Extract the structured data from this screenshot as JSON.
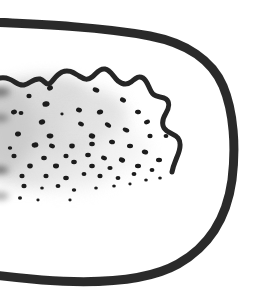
{
  "figure": {
    "caption": "",
    "background_color": "#ffffff",
    "canvas": {
      "width": 260,
      "height": 300
    }
  },
  "colors": {
    "ink": "#2b2b2b",
    "ink_dark": "#1c1c1c",
    "dot": "#1a1a1a",
    "shade_light": "#e3e3e3",
    "shade_mid": "#d4d4d4",
    "shade_edge": "#bdbdbd",
    "paper": "#ffffff"
  },
  "strokes": {
    "body_outline": {
      "label": "body-outline",
      "width": 9,
      "color": "#2b2b2b",
      "path": "M -14 22 C 30 24, 96 26, 150 36 C 186 43, 212 60, 223 86 C 234 112, 236 148, 232 180 C 227 216, 210 246, 178 264 C 146 282, 96 284, 42 280 C 20 278, 2 276, -14 274"
    },
    "outline_top_tail": {
      "label": "outline-top-tail",
      "width": 7,
      "color": "#2b2b2b",
      "path": "M -16 19 C -6 20, 6 22, 18 23"
    },
    "wavy_boundary": {
      "label": "wavy-patch-boundary",
      "width": 5,
      "color": "#262626",
      "path": "M -12 82 C -4 79, 2 76, 9 79 C 15 81, 18 86, 24 85 C 30 84, 33 78, 40 79 C 44 80, 45 84, 48 84 C 52 84, 54 76, 62 72 C 69 69, 74 73, 79 76 C 84 79, 87 81, 92 77 C 96 74, 99 68, 105 69 C 111 70, 113 77, 118 81 C 123 85, 127 85, 131 82 C 135 79, 138 75, 143 78 C 148 81, 149 90, 153 94 C 157 98, 162 96, 166 99 C 170 102, 169 108, 166 113 C 163 118, 161 123, 164 128 C 167 133, 174 133, 178 138 C 182 143, 180 150, 177 157 C 175 162, 173 166, 172 172"
    }
  },
  "shading": {
    "label": "gray-stipple-shading",
    "blobs": [
      {
        "cx": 34,
        "cy": 100,
        "rx": 52,
        "ry": 23,
        "rot": -8,
        "color": "#d9d9d9",
        "opacity": 0.95,
        "blur": 7
      },
      {
        "cx": 58,
        "cy": 118,
        "rx": 66,
        "ry": 30,
        "rot": -6,
        "color": "#dcdcdc",
        "opacity": 0.9,
        "blur": 8
      },
      {
        "cx": 44,
        "cy": 140,
        "rx": 58,
        "ry": 30,
        "rot": -4,
        "color": "#d6d6d6",
        "opacity": 0.9,
        "blur": 8
      },
      {
        "cx": 24,
        "cy": 160,
        "rx": 44,
        "ry": 26,
        "rot": 0,
        "color": "#dadada",
        "opacity": 0.85,
        "blur": 8
      },
      {
        "cx": 92,
        "cy": 126,
        "rx": 34,
        "ry": 22,
        "rot": -10,
        "color": "#e4e4e4",
        "opacity": 0.85,
        "blur": 9
      },
      {
        "cx": 8,
        "cy": 128,
        "rx": 26,
        "ry": 42,
        "rot": 0,
        "color": "#c9c9c9",
        "opacity": 0.9,
        "blur": 8
      },
      {
        "cx": 70,
        "cy": 168,
        "rx": 46,
        "ry": 20,
        "rot": -3,
        "color": "#e6e6e6",
        "opacity": 0.8,
        "blur": 9
      },
      {
        "cx": 120,
        "cy": 150,
        "rx": 28,
        "ry": 20,
        "rot": 0,
        "color": "#efefef",
        "opacity": 0.7,
        "blur": 9
      }
    ],
    "left_edge_smudges": [
      {
        "cx": -2,
        "cy": 92,
        "rx": 12,
        "ry": 5,
        "color": "#5a5a5a",
        "opacity": 0.75,
        "blur": 3
      },
      {
        "cx": -1,
        "cy": 118,
        "rx": 10,
        "ry": 4,
        "color": "#6a6a6a",
        "opacity": 0.7,
        "blur": 3
      },
      {
        "cx": -2,
        "cy": 170,
        "rx": 11,
        "ry": 4,
        "color": "#4f4f4f",
        "opacity": 0.75,
        "blur": 3
      },
      {
        "cx": 0,
        "cy": 196,
        "rx": 9,
        "ry": 4,
        "color": "#707070",
        "opacity": 0.6,
        "blur": 3
      }
    ]
  },
  "stipple": {
    "label": "stipple-dot-field",
    "count": 62,
    "color": "#1a1a1a",
    "dots": [
      {
        "cx": 50,
        "cy": 88,
        "rx": 3.0,
        "ry": 2.4,
        "rot": -25
      },
      {
        "cx": 96,
        "cy": 90,
        "rx": 3.4,
        "ry": 2.4,
        "rot": 20
      },
      {
        "cx": 29,
        "cy": 96,
        "rx": 2.6,
        "ry": 2.2,
        "rot": 0
      },
      {
        "cx": 123,
        "cy": 100,
        "rx": 3.2,
        "ry": 2.3,
        "rot": 30
      },
      {
        "cx": 14,
        "cy": 112,
        "rx": 3.0,
        "ry": 2.3,
        "rot": -15
      },
      {
        "cx": 46,
        "cy": 104,
        "rx": 3.6,
        "ry": 2.8,
        "rot": -10
      },
      {
        "cx": 21,
        "cy": 113,
        "rx": 2.4,
        "ry": 2.0,
        "rot": 0
      },
      {
        "cx": 79,
        "cy": 110,
        "rx": 3.0,
        "ry": 2.4,
        "rot": 15
      },
      {
        "cx": 100,
        "cy": 112,
        "rx": 3.2,
        "ry": 2.4,
        "rot": -20
      },
      {
        "cx": 138,
        "cy": 112,
        "rx": 3.0,
        "ry": 2.2,
        "rot": 10
      },
      {
        "cx": 62,
        "cy": 114,
        "rx": 1.6,
        "ry": 1.4,
        "rot": 0
      },
      {
        "cx": 42,
        "cy": 122,
        "rx": 3.2,
        "ry": 2.6,
        "rot": -12
      },
      {
        "cx": 81,
        "cy": 124,
        "rx": 3.0,
        "ry": 2.2,
        "rot": 25
      },
      {
        "cx": 108,
        "cy": 125,
        "rx": 3.4,
        "ry": 2.2,
        "rot": 35
      },
      {
        "cx": 147,
        "cy": 122,
        "rx": 3.0,
        "ry": 2.2,
        "rot": -18
      },
      {
        "cx": 126,
        "cy": 130,
        "rx": 3.4,
        "ry": 2.2,
        "rot": 25
      },
      {
        "cx": 18,
        "cy": 134,
        "rx": 3.0,
        "ry": 2.4,
        "rot": -8
      },
      {
        "cx": 50,
        "cy": 136,
        "rx": 3.4,
        "ry": 2.4,
        "rot": -5
      },
      {
        "cx": 92,
        "cy": 136,
        "rx": 3.2,
        "ry": 2.6,
        "rot": 12
      },
      {
        "cx": 150,
        "cy": 136,
        "rx": 2.6,
        "ry": 2.2,
        "rot": 0
      },
      {
        "cx": 166,
        "cy": 136,
        "rx": 2.4,
        "ry": 2.0,
        "rot": 0
      },
      {
        "cx": 35,
        "cy": 145,
        "rx": 3.4,
        "ry": 2.6,
        "rot": -10
      },
      {
        "cx": 52,
        "cy": 146,
        "rx": 3.0,
        "ry": 2.2,
        "rot": 20
      },
      {
        "cx": 72,
        "cy": 146,
        "rx": 2.8,
        "ry": 2.4,
        "rot": 0
      },
      {
        "cx": 92,
        "cy": 144,
        "rx": 2.8,
        "ry": 2.2,
        "rot": 0
      },
      {
        "cx": 112,
        "cy": 142,
        "rx": 3.0,
        "ry": 2.2,
        "rot": 15
      },
      {
        "cx": 130,
        "cy": 146,
        "rx": 3.0,
        "ry": 2.2,
        "rot": 0
      },
      {
        "cx": 145,
        "cy": 152,
        "rx": 3.2,
        "ry": 2.4,
        "rot": 18
      },
      {
        "cx": 14,
        "cy": 156,
        "rx": 2.6,
        "ry": 2.2,
        "rot": 0
      },
      {
        "cx": 44,
        "cy": 158,
        "rx": 2.8,
        "ry": 2.2,
        "rot": 0
      },
      {
        "cx": 66,
        "cy": 156,
        "rx": 2.6,
        "ry": 2.2,
        "rot": 0
      },
      {
        "cx": 88,
        "cy": 155,
        "rx": 2.8,
        "ry": 2.2,
        "rot": 0
      },
      {
        "cx": 104,
        "cy": 158,
        "rx": 3.0,
        "ry": 2.2,
        "rot": 20
      },
      {
        "cx": 122,
        "cy": 160,
        "rx": 3.2,
        "ry": 2.4,
        "rot": 25
      },
      {
        "cx": 159,
        "cy": 160,
        "rx": 3.0,
        "ry": 2.2,
        "rot": 0
      },
      {
        "cx": 30,
        "cy": 166,
        "rx": 2.8,
        "ry": 2.4,
        "rot": 0
      },
      {
        "cx": 56,
        "cy": 166,
        "rx": 3.0,
        "ry": 2.4,
        "rot": 0
      },
      {
        "cx": 74,
        "cy": 162,
        "rx": 2.8,
        "ry": 2.2,
        "rot": 0
      },
      {
        "cx": 92,
        "cy": 166,
        "rx": 2.8,
        "ry": 2.2,
        "rot": 0
      },
      {
        "cx": 110,
        "cy": 168,
        "rx": 2.6,
        "ry": 2.0,
        "rot": 0
      },
      {
        "cx": 138,
        "cy": 166,
        "rx": 3.0,
        "ry": 2.2,
        "rot": 0
      },
      {
        "cx": 152,
        "cy": 170,
        "rx": 2.4,
        "ry": 2.0,
        "rot": 0
      },
      {
        "cx": 22,
        "cy": 176,
        "rx": 2.6,
        "ry": 2.2,
        "rot": 0
      },
      {
        "cx": 46,
        "cy": 176,
        "rx": 2.6,
        "ry": 2.2,
        "rot": 0
      },
      {
        "cx": 66,
        "cy": 178,
        "rx": 2.8,
        "ry": 2.2,
        "rot": 0
      },
      {
        "cx": 84,
        "cy": 174,
        "rx": 2.4,
        "ry": 2.0,
        "rot": 0
      },
      {
        "cx": 100,
        "cy": 176,
        "rx": 2.6,
        "ry": 2.2,
        "rot": 0
      },
      {
        "cx": 118,
        "cy": 178,
        "rx": 2.4,
        "ry": 2.0,
        "rot": 0
      },
      {
        "cx": 134,
        "cy": 174,
        "rx": 2.4,
        "ry": 2.0,
        "rot": 0
      },
      {
        "cx": 146,
        "cy": 180,
        "rx": 1.8,
        "ry": 1.6,
        "rot": 0
      },
      {
        "cx": 160,
        "cy": 178,
        "rx": 1.8,
        "ry": 1.6,
        "rot": 0
      },
      {
        "cx": 24,
        "cy": 186,
        "rx": 2.6,
        "ry": 2.2,
        "rot": 0
      },
      {
        "cx": 42,
        "cy": 188,
        "rx": 1.8,
        "ry": 1.6,
        "rot": 0
      },
      {
        "cx": 58,
        "cy": 186,
        "rx": 2.4,
        "ry": 2.0,
        "rot": 0
      },
      {
        "cx": 74,
        "cy": 190,
        "rx": 2.2,
        "ry": 1.8,
        "rot": 0
      },
      {
        "cx": 96,
        "cy": 188,
        "rx": 1.8,
        "ry": 1.6,
        "rot": 0
      },
      {
        "cx": 114,
        "cy": 186,
        "rx": 1.8,
        "ry": 1.6,
        "rot": 0
      },
      {
        "cx": 130,
        "cy": 184,
        "rx": 1.6,
        "ry": 1.4,
        "rot": 0
      },
      {
        "cx": 20,
        "cy": 198,
        "rx": 2.0,
        "ry": 1.8,
        "rot": 0
      },
      {
        "cx": 38,
        "cy": 200,
        "rx": 1.6,
        "ry": 1.4,
        "rot": 0
      },
      {
        "cx": 70,
        "cy": 200,
        "rx": 1.6,
        "ry": 1.4,
        "rot": 0
      },
      {
        "cx": 10,
        "cy": 148,
        "rx": 2.2,
        "ry": 1.8,
        "rot": 0
      }
    ]
  }
}
